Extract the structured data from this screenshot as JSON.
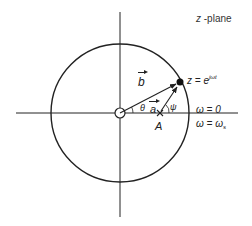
{
  "diagram": {
    "title_parts": {
      "var": "z",
      "suffix": " -plane"
    },
    "geometry": {
      "origin": [
        120,
        113
      ],
      "radius": 69,
      "x_axis": [
        16,
        238
      ],
      "y_axis": [
        12,
        217
      ],
      "point_z": [
        180,
        82
      ],
      "point_A": [
        160,
        113
      ]
    },
    "labels": {
      "z_equation": {
        "base": "z = e",
        "exponent": "jωt"
      },
      "vector_b": "b",
      "vector_a": "a",
      "angle_theta": "θ",
      "angle_psi": "ψ",
      "point_A": "A",
      "omega_zero": "ω = 0",
      "omega_s": {
        "base": "ω = ω",
        "subscript": "s"
      }
    },
    "elements": {
      "unit_circle": "unit circle",
      "origin_marker": "zero at origin (circle)",
      "pole_marker": "x",
      "point_on_circle": "filled dot"
    },
    "colors": {
      "stroke": "#222222",
      "background": "#ffffff"
    }
  }
}
